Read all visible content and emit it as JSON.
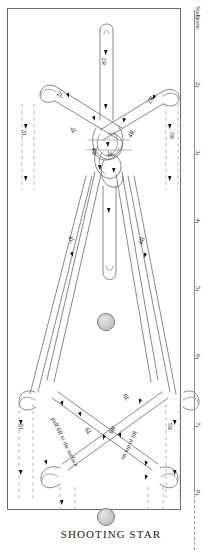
{
  "document": {
    "title": "SHOOTING STAR",
    "type": "knot-tying diagram"
  },
  "ruler": {
    "heading": "Stations:",
    "ticks": [
      {
        "label": "1",
        "y": 18
      },
      {
        "label": "2",
        "y": 86
      },
      {
        "label": "3",
        "y": 154
      },
      {
        "label": "4",
        "y": 222
      },
      {
        "label": "5",
        "y": 290
      },
      {
        "label": "6",
        "y": 358
      },
      {
        "label": "7",
        "y": 426
      },
      {
        "label": "8",
        "y": 494
      }
    ]
  },
  "cord_labels": [
    {
      "name": "2R-top",
      "text": "2R",
      "x": 106,
      "y": 62,
      "rot": 90
    },
    {
      "name": "2L-left",
      "text": "2L",
      "x": 63,
      "y": 95,
      "rot": 35
    },
    {
      "name": "2R-right",
      "text": "2R",
      "x": 152,
      "y": 100,
      "rot": -60
    },
    {
      "name": "3L-left",
      "text": "3L",
      "x": 27,
      "y": 134,
      "rot": 90
    },
    {
      "name": "3R-right",
      "text": "3R",
      "x": 174,
      "y": 136,
      "rot": 90
    },
    {
      "name": "4L-upper",
      "text": "4L",
      "x": 76,
      "y": 131,
      "rot": 62
    },
    {
      "name": "4R-upper",
      "text": "4R",
      "x": 133,
      "y": 134,
      "rot": -62
    },
    {
      "name": "4R-center",
      "text": "4R",
      "x": 96,
      "y": 152,
      "rot": 90
    },
    {
      "name": "2L-center",
      "text": "2L",
      "x": 113,
      "y": 155,
      "rot": 90
    },
    {
      "name": "4L-lower",
      "text": "4L",
      "x": 74,
      "y": 240,
      "rot": 66
    },
    {
      "name": "4R-lower",
      "text": "4R",
      "x": 143,
      "y": 241,
      "rot": -66
    },
    {
      "name": "6L-upper",
      "text": "6L",
      "x": 129,
      "y": 398,
      "rot": 62
    },
    {
      "name": "5L",
      "text": "5L",
      "x": 24,
      "y": 428,
      "rot": 90
    },
    {
      "name": "5R",
      "text": "5R",
      "x": 172,
      "y": 427,
      "rot": 90
    },
    {
      "name": "6L-center",
      "text": "6L",
      "x": 91,
      "y": 432,
      "rot": 62
    },
    {
      "name": "6R-center",
      "text": "6R",
      "x": 114,
      "y": 430,
      "rot": -62
    }
  ],
  "phrases": [
    {
      "name": "pull-instruction",
      "text": "pull 6R to the surface",
      "x": 66,
      "y": 443,
      "rot": 64
    },
    {
      "name": "ontop-instruction",
      "text": "on top of 6R",
      "x": 141,
      "y": 446,
      "rot": -64
    }
  ],
  "beads": [
    {
      "name": "bead-middle",
      "x": 97,
      "y": 313,
      "size": 16
    },
    {
      "name": "bead-bottom",
      "x": 97,
      "y": 508,
      "size": 16
    }
  ]
}
